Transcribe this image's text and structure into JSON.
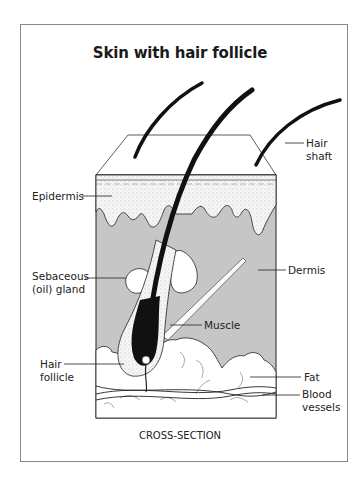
{
  "title": "Skin with hair follicle",
  "caption": "CROSS-SECTION",
  "labels": {
    "hair_shaft": [
      "Hair",
      "shaft"
    ],
    "epidermis": "Epidermis",
    "dermis": "Dermis",
    "sebaceous_gland": [
      "Sebaceous",
      "(oil) gland"
    ],
    "muscle": "Muscle",
    "hair_follicle": [
      "Hair",
      "follicle"
    ],
    "fat": "Fat",
    "blood_vessels": [
      "Blood",
      "vessels"
    ]
  },
  "colors": {
    "dermis": "#c6c6c6",
    "epidermis": "#f4f4f4",
    "hair": "#111111",
    "fat": "#ffffff",
    "frame": "#888888"
  }
}
